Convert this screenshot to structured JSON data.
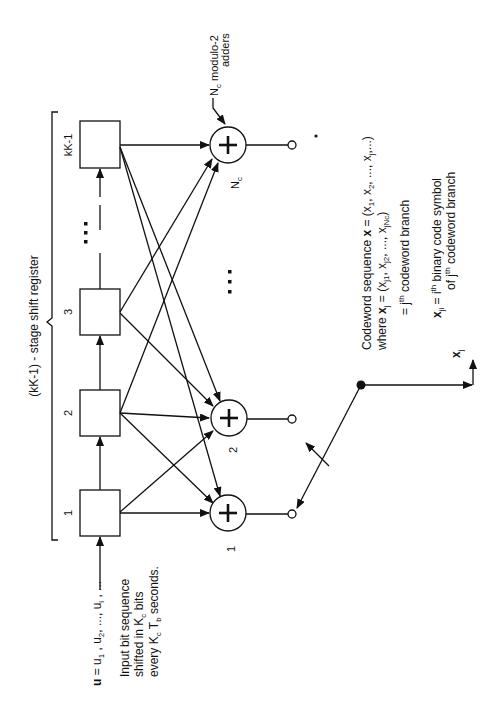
{
  "diagram": {
    "orientation": "rotated 90 degrees counter-clockwise",
    "register": {
      "label": "(kK-1) - stage shift register",
      "stages": [
        {
          "id": "stage-1",
          "label": "1"
        },
        {
          "id": "stage-2",
          "label": "2"
        },
        {
          "id": "stage-3",
          "label": "3"
        },
        {
          "id": "stage-kK-1",
          "label": "kK-1"
        }
      ],
      "ellipsis": "⋮"
    },
    "adders": {
      "annotation_main": "modulo-2",
      "annotation_sub": "adders",
      "annotation_prefix": "N",
      "annotation_prefix_sub": "c",
      "items": [
        {
          "id": "adder-1",
          "label": "1",
          "symbol": "+"
        },
        {
          "id": "adder-2",
          "label": "2",
          "symbol": "+"
        },
        {
          "id": "adder-Nc",
          "label": "N",
          "label_sub": "c",
          "symbol": "+"
        }
      ],
      "ellipsis": "⋮"
    },
    "input": {
      "sequence_label": "u = u1 , u2, ..., ui , ...",
      "u_bold": "u",
      "eq": " = u",
      "s1": "1",
      "sep1": " , u",
      "s2": "2",
      "sep2": ", ..., u",
      "si": "i",
      "tail": " , ...",
      "desc_line1": "Input bit sequence",
      "desc_line2_a": "shifted in K",
      "desc_line2_sub": "c",
      "desc_line2_b": " bits",
      "desc_line3_a": "every K",
      "desc_line3_sub1": "c",
      "desc_line3_b": " T",
      "desc_line3_sub2": "b",
      "desc_line3_c": " seconds."
    },
    "output": {
      "switch": "commutator switch",
      "output_label": "x",
      "output_sub": "j",
      "codeword_line1_a": "Codeword sequence ",
      "codeword_line1_b": "x",
      "codeword_line1_c": " = (x",
      "codeword_line1_d": "1",
      "codeword_line1_e": ", x",
      "codeword_line1_f": "2",
      "codeword_line1_g": ", ..., x",
      "codeword_line1_h": "j",
      "codeword_line1_i": ",...)",
      "where_a": "where ",
      "where_b": "x",
      "where_c": "j",
      "where_d": " = (x",
      "where_e": "j1",
      "where_f": ", x",
      "where_g": "j2",
      "where_h": ", ..., x",
      "where_i": "jNc",
      "where_j": ")",
      "branch_eq": "= j",
      "branch_sup": "th",
      "branch_text": " codeword branch",
      "xji_a": "x",
      "xji_sub": "ji",
      "xji_b": " = i",
      "xji_sup": "th",
      "xji_c": " binary code symbol",
      "xji_line2_a": "of j",
      "xji_line2_sup": "th",
      "xji_line2_b": " codeword branch"
    }
  }
}
